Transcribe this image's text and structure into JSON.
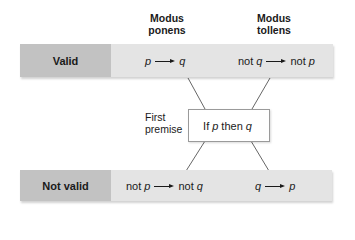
{
  "columns": [
    {
      "id": "modus-ponens",
      "line1": "Modus",
      "line2": "ponens"
    },
    {
      "id": "modus-tollens",
      "line1": "Modus",
      "line2": "tollens"
    }
  ],
  "rows": [
    {
      "label": "Valid",
      "cells": [
        {
          "antecedent_prefix": "",
          "antecedent_var": "p",
          "consequent_prefix": "",
          "consequent_var": "q"
        },
        {
          "antecedent_prefix": "not ",
          "antecedent_var": "q",
          "consequent_prefix": "not ",
          "consequent_var": "p"
        }
      ]
    },
    {
      "label": "Not valid",
      "cells": [
        {
          "antecedent_prefix": "not ",
          "antecedent_var": "p",
          "consequent_prefix": "not ",
          "consequent_var": "q"
        },
        {
          "antecedent_prefix": "",
          "antecedent_var": "q",
          "consequent_prefix": "",
          "consequent_var": "p"
        }
      ]
    }
  ],
  "premise": {
    "label_line1": "First",
    "label_line2": "premise",
    "text_if": "If",
    "text_p": "p",
    "text_then": "then",
    "text_q": "q"
  },
  "colors": {
    "label_bg": "#c2c2c2",
    "bar_bg": "#e4e4e4",
    "line": "#555555",
    "box_border": "#9a9a9a"
  }
}
